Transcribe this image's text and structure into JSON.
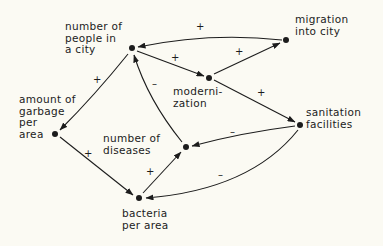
{
  "diagram": {
    "type": "causal-loop",
    "nodes": [
      {
        "id": "people",
        "label": "number of\npeople in\na city"
      },
      {
        "id": "migration",
        "label": "migration\ninto city"
      },
      {
        "id": "modernization",
        "label": "moderni-\nzation"
      },
      {
        "id": "sanitation",
        "label": "sanitation\nfacilities"
      },
      {
        "id": "garbage",
        "label": "amount of\ngarbage\nper\narea"
      },
      {
        "id": "diseases",
        "label": "number of\ndiseases"
      },
      {
        "id": "bacteria",
        "label": "bacteria\nper area"
      }
    ],
    "edges": [
      {
        "from": "migration",
        "to": "people",
        "sign": "+"
      },
      {
        "from": "people",
        "to": "modernization",
        "sign": "+"
      },
      {
        "from": "modernization",
        "to": "migration",
        "sign": "+"
      },
      {
        "from": "modernization",
        "to": "sanitation",
        "sign": "+"
      },
      {
        "from": "people",
        "to": "garbage",
        "sign": "+"
      },
      {
        "from": "garbage",
        "to": "bacteria",
        "sign": "+"
      },
      {
        "from": "bacteria",
        "to": "diseases",
        "sign": "+"
      },
      {
        "from": "diseases",
        "to": "people",
        "sign": "–"
      },
      {
        "from": "sanitation",
        "to": "diseases",
        "sign": "–"
      },
      {
        "from": "sanitation",
        "to": "bacteria",
        "sign": "–"
      }
    ],
    "colors": {
      "ink": "#1c1c1c",
      "background": "#fbfaf3"
    }
  }
}
